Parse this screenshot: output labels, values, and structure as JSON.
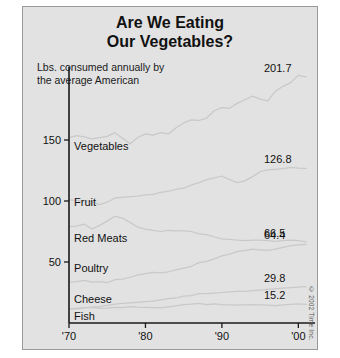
{
  "title": {
    "line1": "Are We Eating",
    "line2": "Our Vegetables?"
  },
  "subtitle": {
    "line1": "Lbs. consumed annually by",
    "line2": "the average American"
  },
  "credit": "© 2002 Time Inc.",
  "chart_data": {
    "type": "line",
    "title": "Are We Eating Our Vegetables?",
    "subtitle": "Lbs. consumed annually by the average American",
    "xlabel": "",
    "ylabel": "",
    "xlim": [
      1970,
      2001
    ],
    "ylim": [
      0,
      215
    ],
    "grid": false,
    "legend": "inline-left-labels",
    "xticks": [
      1970,
      1980,
      1990,
      2000
    ],
    "xtick_labels": [
      "'70",
      "'80",
      "'90",
      "'00"
    ],
    "yticks": [
      50,
      100,
      150
    ],
    "ytick_labels": [
      "50",
      "100",
      "150"
    ],
    "x": [
      1970,
      1971,
      1972,
      1973,
      1974,
      1975,
      1976,
      1977,
      1978,
      1979,
      1980,
      1981,
      1982,
      1983,
      1984,
      1985,
      1986,
      1987,
      1988,
      1989,
      1990,
      1991,
      1992,
      1993,
      1994,
      1995,
      1996,
      1997,
      1998,
      1999,
      2000,
      2001
    ],
    "series": [
      {
        "name": "Vegetables",
        "end_value": 201.7,
        "end_label": "201.7",
        "values": [
          152.0,
          153.5,
          152.5,
          151.0,
          152.0,
          153.0,
          156.0,
          151.5,
          147.0,
          152.0,
          155.0,
          154.0,
          156.0,
          155.0,
          160.0,
          164.0,
          166.5,
          166.0,
          168.0,
          174.0,
          176.5,
          176.0,
          180.0,
          183.0,
          186.0,
          183.5,
          182.0,
          190.0,
          194.0,
          197.0,
          203.0,
          201.7
        ]
      },
      {
        "name": "Fruit",
        "end_value": 126.8,
        "end_label": "126.8",
        "values": [
          101.0,
          100.5,
          100.0,
          99.5,
          97.0,
          99.0,
          102.5,
          103.0,
          103.5,
          104.0,
          105.0,
          105.5,
          107.0,
          108.0,
          109.5,
          110.5,
          113.0,
          115.0,
          117.5,
          119.0,
          120.5,
          117.5,
          115.0,
          116.5,
          120.0,
          124.0,
          125.5,
          126.0,
          126.5,
          127.5,
          127.0,
          126.8
        ]
      },
      {
        "name": "Red Meats",
        "end_value": 66.5,
        "end_label": "66.5",
        "values": [
          79.0,
          79.5,
          81.0,
          77.0,
          80.0,
          83.5,
          87.5,
          86.0,
          82.5,
          78.5,
          77.0,
          76.0,
          75.0,
          76.0,
          75.5,
          75.5,
          75.0,
          73.0,
          72.5,
          70.5,
          69.0,
          68.5,
          68.0,
          67.5,
          68.0,
          68.0,
          67.5,
          67.0,
          67.5,
          68.0,
          67.5,
          66.5
        ]
      },
      {
        "name": "Poultry",
        "end_value": 64.4,
        "end_label": "64.4",
        "values": [
          33.5,
          34.0,
          35.0,
          33.5,
          34.0,
          33.0,
          35.5,
          36.0,
          37.5,
          39.5,
          40.5,
          41.5,
          41.0,
          42.0,
          43.5,
          45.0,
          46.5,
          49.5,
          50.5,
          52.5,
          55.0,
          56.5,
          58.5,
          59.5,
          60.5,
          60.0,
          59.5,
          60.5,
          62.0,
          63.5,
          64.0,
          64.4
        ]
      },
      {
        "name": "Cheese",
        "end_value": 29.8,
        "end_label": "29.8",
        "values": [
          11.5,
          12.0,
          12.5,
          13.0,
          13.5,
          14.5,
          15.5,
          16.0,
          16.5,
          17.0,
          17.5,
          18.0,
          19.0,
          20.0,
          20.5,
          22.0,
          22.5,
          24.0,
          24.0,
          24.5,
          25.0,
          25.5,
          26.0,
          26.0,
          26.5,
          27.0,
          27.5,
          28.0,
          28.5,
          29.0,
          29.5,
          29.8
        ]
      },
      {
        "name": "Fish",
        "end_value": 15.2,
        "end_label": "15.2",
        "values": [
          11.8,
          11.5,
          12.5,
          12.8,
          12.0,
          12.2,
          12.9,
          12.6,
          13.4,
          13.0,
          12.8,
          12.6,
          12.4,
          13.3,
          14.1,
          15.0,
          15.4,
          16.1,
          15.1,
          15.6,
          15.0,
          14.8,
          14.7,
          14.9,
          15.1,
          14.9,
          14.7,
          14.3,
          14.8,
          15.2,
          15.6,
          15.2
        ]
      }
    ],
    "series_label_positions": [
      {
        "name": "Vegetables",
        "x": 1970.4,
        "y": 145
      },
      {
        "name": "Fruit",
        "x": 1970.4,
        "y": 99
      },
      {
        "name": "Red Meats",
        "x": 1970.4,
        "y": 70
      },
      {
        "name": "Poultry",
        "x": 1970.4,
        "y": 45
      },
      {
        "name": "Cheese",
        "x": 1970.4,
        "y": 20
      },
      {
        "name": "Fish",
        "x": 1970.4,
        "y": 6
      }
    ]
  }
}
